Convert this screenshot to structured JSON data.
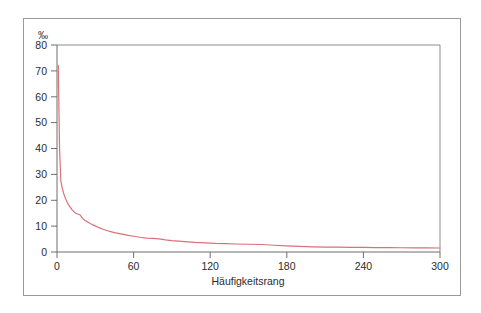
{
  "figure": {
    "background_color": "#ffffff",
    "frame_color": "#9a9a9a",
    "axis_color": "#6f6f6f"
  },
  "chart_data": {
    "type": "line",
    "title": "",
    "subtitle": "",
    "xlabel": "Häufigkeitsrang",
    "ylabel": "",
    "y_unit_label": "‰",
    "series_color": "#d9717a",
    "grid": false,
    "legend": null,
    "xlim": [
      0,
      300
    ],
    "ylim": [
      0,
      80
    ],
    "xticks": [
      0,
      60,
      120,
      180,
      240,
      300
    ],
    "xtick_labels": [
      "0",
      "60",
      "120",
      "180",
      "240",
      "300"
    ],
    "yticks": [
      0,
      10,
      20,
      30,
      40,
      50,
      60,
      70,
      80
    ],
    "ytick_labels": [
      "0",
      "10",
      "20",
      "30",
      "40",
      "50",
      "60",
      "70",
      "80"
    ],
    "x": [
      1,
      2,
      3,
      4,
      5,
      6,
      7,
      8,
      9,
      10,
      12,
      14,
      16,
      18,
      20,
      22,
      24,
      26,
      28,
      30,
      33,
      36,
      39,
      42,
      45,
      48,
      52,
      56,
      60,
      65,
      70,
      75,
      80,
      85,
      90,
      95,
      100,
      108,
      116,
      124,
      132,
      140,
      150,
      160,
      170,
      180,
      190,
      200,
      210,
      220,
      230,
      240,
      250,
      260,
      270,
      280,
      290,
      300
    ],
    "values": [
      72.0,
      40.0,
      27.5,
      25.0,
      23.0,
      21.5,
      20.3,
      19.2,
      18.3,
      17.5,
      16.2,
      15.2,
      14.7,
      14.4,
      13.0,
      12.2,
      11.6,
      11.0,
      10.5,
      10.1,
      9.4,
      8.8,
      8.3,
      7.9,
      7.5,
      7.2,
      6.8,
      6.4,
      6.1,
      5.7,
      5.4,
      5.3,
      5.1,
      4.7,
      4.4,
      4.2,
      4.0,
      3.7,
      3.5,
      3.3,
      3.2,
      3.1,
      3.0,
      2.9,
      2.6,
      2.4,
      2.2,
      2.0,
      1.9,
      1.85,
      1.8,
      1.75,
      1.7,
      1.68,
      1.65,
      1.62,
      1.6,
      1.55
    ]
  }
}
